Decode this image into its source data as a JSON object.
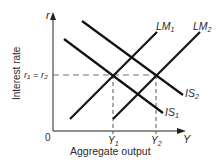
{
  "diagram": {
    "type": "IS-LM",
    "axes": {
      "y_axis_symbol": "r",
      "x_axis_symbol": "Y",
      "y_axis_label": "Interest rate",
      "x_axis_label": "Aggregate output",
      "origin_label": "0"
    },
    "levels": {
      "interest_rate_label": "r₁ = r₂",
      "output_1_label": "Y",
      "output_1_sub": "1",
      "output_2_label": "Y",
      "output_2_sub": "2"
    },
    "curves": [
      {
        "name": "LM",
        "sub": "1"
      },
      {
        "name": "LM",
        "sub": "2"
      },
      {
        "name": "IS",
        "sub": "1"
      },
      {
        "name": "IS",
        "sub": "2"
      }
    ],
    "colors": {
      "line": "#111111",
      "dashed": "#707070",
      "text": "#2a2a2a"
    }
  }
}
